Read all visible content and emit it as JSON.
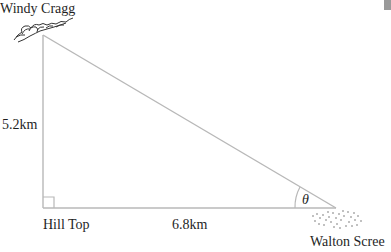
{
  "diagram": {
    "type": "right-triangle",
    "labels": {
      "top_vertex": "Windy Cragg",
      "right_angle_vertex": "Hill Top",
      "acute_vertex": "Walton Scree",
      "vertical_side": "5.2km",
      "horizontal_side": "6.8km",
      "angle": "θ"
    },
    "colors": {
      "line": "#b8b8b8",
      "text": "#1f1f1f"
    }
  }
}
